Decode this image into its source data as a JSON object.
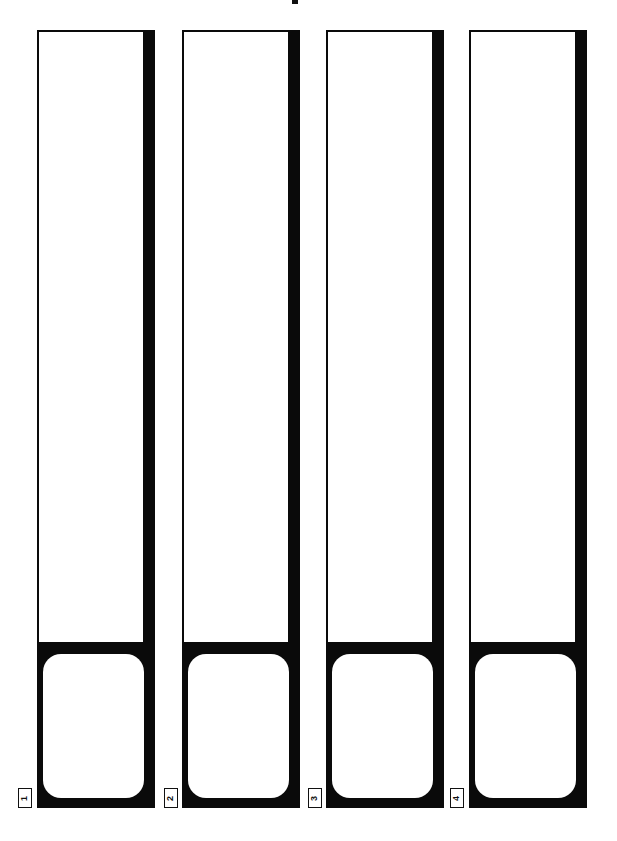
{
  "page": {
    "type": "printable template",
    "background": "#ffffff",
    "ink": "#0a0a0a"
  },
  "strips": [
    {
      "number": "1",
      "x": 37
    },
    {
      "number": "2",
      "x": 182
    },
    {
      "number": "3",
      "x": 326
    },
    {
      "number": "4",
      "x": 469
    }
  ]
}
